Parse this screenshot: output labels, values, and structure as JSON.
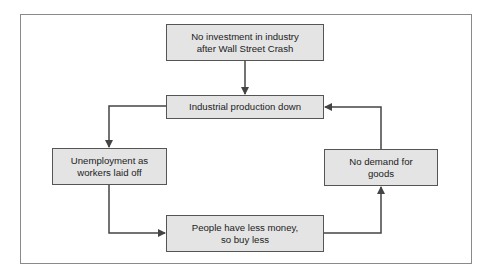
{
  "diagram": {
    "type": "flowchart-cycle",
    "colors": {
      "box_fill": "#e4e4e4",
      "box_border": "#555555",
      "line": "#444444",
      "frame_border": "#8a8a8a"
    },
    "nodes": [
      {
        "id": "no_investment",
        "label": "No investment in industry\nafter Wall Street Crash"
      },
      {
        "id": "production_down",
        "label": "Industrial production down"
      },
      {
        "id": "unemployment",
        "label": "Unemployment as\nworkers laid off"
      },
      {
        "id": "less_money",
        "label": "People have less money,\nso buy less"
      },
      {
        "id": "no_demand",
        "label": "No demand for\ngoods"
      }
    ],
    "edges": [
      {
        "from": "no_investment",
        "to": "production_down"
      },
      {
        "from": "production_down",
        "to": "unemployment"
      },
      {
        "from": "unemployment",
        "to": "less_money"
      },
      {
        "from": "less_money",
        "to": "no_demand"
      },
      {
        "from": "no_demand",
        "to": "production_down"
      }
    ]
  }
}
